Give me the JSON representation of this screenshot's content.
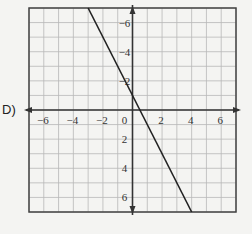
{
  "option_label": "D)",
  "chart_data": {
    "type": "line",
    "title": "",
    "xlabel": "",
    "ylabel": "",
    "xlim": [
      -7,
      7
    ],
    "ylim": [
      -7,
      7
    ],
    "grid": true,
    "x_ticks": [
      -6,
      -4,
      -2,
      0,
      2,
      4,
      6
    ],
    "y_ticks": [
      -6,
      -4,
      -2,
      2,
      4,
      6
    ],
    "x_tick_labels": [
      "−6",
      "−4",
      "−2",
      "0",
      "2",
      "4",
      "6"
    ],
    "y_tick_labels": [
      "6",
      "4",
      "2",
      "−2",
      "−4",
      "−6"
    ],
    "series": [
      {
        "name": "y = -2x + 1",
        "slope": -2,
        "intercept": 1,
        "points": [
          [
            -3,
            7
          ],
          [
            4,
            -7
          ]
        ]
      }
    ]
  },
  "colors": {
    "background": "#f4f4f2",
    "grid": "#b8b8b8",
    "axis": "#333333",
    "line": "#222222",
    "border": "#444444"
  }
}
